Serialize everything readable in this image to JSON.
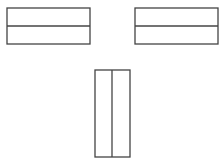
{
  "diagram": {
    "background": "#ffffff",
    "stroke_color": "#444444",
    "stroke_width": 1.3,
    "shapes": [
      {
        "id": "left-horizontal-rect",
        "x": 7,
        "y": 8,
        "width": 83,
        "height": 36,
        "divider": {
          "orientation": "horizontal",
          "position": 26
        }
      },
      {
        "id": "right-horizontal-rect",
        "x": 135,
        "y": 8,
        "width": 83,
        "height": 36,
        "divider": {
          "orientation": "horizontal",
          "position": 26
        }
      },
      {
        "id": "bottom-vertical-rect",
        "x": 95,
        "y": 70,
        "width": 35,
        "height": 87,
        "divider": {
          "orientation": "vertical",
          "position": 112
        }
      }
    ]
  }
}
